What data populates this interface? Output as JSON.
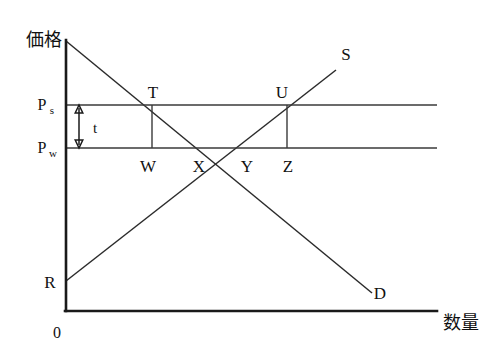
{
  "figure": {
    "type": "economics-supply-demand-diagram",
    "background_color": "#ffffff",
    "line_color": "#1a1a1a"
  },
  "axes": {
    "y_label": "価格",
    "x_label": "数量",
    "origin_label": "0",
    "y_axis": {
      "x": 66,
      "top": 40,
      "bottom": 311
    },
    "x_axis": {
      "y": 311,
      "left": 66,
      "right": 437
    }
  },
  "price_levels": [
    {
      "name": "supported-price",
      "symbol": "P",
      "subscript": "s",
      "y": 105,
      "line_from_x": 66,
      "line_to_x": 437,
      "label_x": 40,
      "label_y": 105
    },
    {
      "name": "world-price",
      "symbol": "P",
      "subscript": "w",
      "y": 148,
      "line_from_x": 66,
      "line_to_x": 437,
      "label_x": 40,
      "label_y": 148
    }
  ],
  "tax_marker": {
    "label": "t",
    "label_x": 95,
    "label_y": 131,
    "arrow_x": 79,
    "arrow_top_y": 106,
    "arrow_bottom_y": 147
  },
  "curves": [
    {
      "name": "demand-curve",
      "label": "D",
      "label_x": 380,
      "label_y": 297,
      "x1": 66,
      "y1": 41,
      "x2": 372,
      "y2": 293
    },
    {
      "name": "supply-curve",
      "label": "S",
      "label_x": 345,
      "label_y": 58,
      "x1": 66,
      "y1": 281,
      "x2": 336,
      "y2": 70
    }
  ],
  "points": [
    {
      "name": "point-T",
      "label": "T",
      "x": 152,
      "y": 105,
      "label_x": 152,
      "label_y": 96
    },
    {
      "name": "point-U",
      "label": "U",
      "x": 287,
      "y": 105,
      "label_x": 282,
      "label_y": 96
    },
    {
      "name": "point-R",
      "label": "R",
      "x": 66,
      "y": 281,
      "label_x": 50,
      "label_y": 288
    },
    {
      "name": "point-W",
      "label": "W",
      "x": 152,
      "y": 148,
      "label_x": 146,
      "label_y": 171
    },
    {
      "name": "point-X",
      "label": "X",
      "x": 199,
      "y": 148,
      "label_x": 196,
      "label_y": 171
    },
    {
      "name": "point-Y",
      "label": "Y",
      "x": 247,
      "y": 148,
      "label_x": 245,
      "label_y": 171
    },
    {
      "name": "point-Z",
      "label": "Z",
      "x": 287,
      "y": 148,
      "label_x": 284,
      "label_y": 171
    }
  ],
  "drop_lines": [
    {
      "name": "drop-line-TW",
      "x": 152,
      "y_top": 105,
      "y_bottom": 148
    },
    {
      "name": "drop-line-UZ",
      "x": 287,
      "y_top": 105,
      "y_bottom": 148
    }
  ]
}
